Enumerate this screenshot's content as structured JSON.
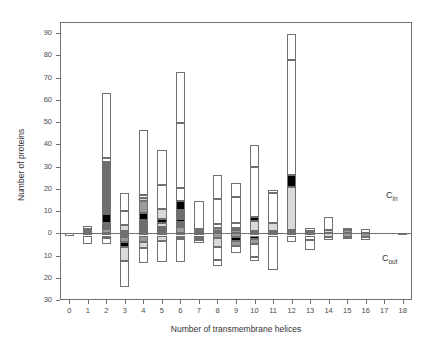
{
  "figure": {
    "title_fragment": "",
    "annotations": [
      {
        "name": "c-in-label",
        "base": "C",
        "sub": "in",
        "x": 386,
        "y": 190
      },
      {
        "name": "c-out-label",
        "base": "C",
        "sub": "out",
        "x": 382,
        "y": 253
      }
    ]
  },
  "chart_data": {
    "type": "bar",
    "title": "",
    "subtitle": "",
    "xlabel": "Number of transmembrane helices",
    "ylabel": "Number of proteins",
    "orientation": "vertical",
    "stacked": true,
    "diverging": true,
    "grid": false,
    "legend": "none",
    "note": "Diverging stacked bars. Upward stacks = C_in topology, downward stacks = C_out topology. Y tick labels below zero are unsigned magnitudes.",
    "xlim": [
      -0.5,
      18.5
    ],
    "ylim": [
      -30,
      95
    ],
    "xticks": [
      0,
      1,
      2,
      3,
      4,
      5,
      6,
      7,
      8,
      9,
      10,
      11,
      12,
      13,
      14,
      15,
      16,
      17,
      18
    ],
    "xticklabels": [
      "0",
      "1",
      "2",
      "3",
      "4",
      "5",
      "6",
      "7",
      "8",
      "9",
      "10",
      "11",
      "12",
      "13",
      "14",
      "15",
      "16",
      "17",
      "18"
    ],
    "yticks": [
      90,
      80,
      70,
      60,
      50,
      40,
      30,
      20,
      10,
      0,
      -10,
      -20,
      -30
    ],
    "yticklabels": [
      "90",
      "80",
      "70",
      "60",
      "50",
      "40",
      "30",
      "20",
      "10",
      "0",
      "10",
      "20",
      "30"
    ],
    "segment_fills": {
      "white": "#ffffff",
      "light_gray": "#d9d9d9",
      "mid_gray": "#9a9a9a",
      "dark_gray": "#6e6e6e",
      "black": "#000000"
    },
    "categories": [
      0,
      1,
      2,
      3,
      4,
      5,
      6,
      7,
      8,
      9,
      10,
      11,
      12,
      13,
      14,
      15,
      16,
      17,
      18
    ],
    "bars": [
      {
        "x": 0,
        "up": [],
        "down": [
          {
            "v": 1.2,
            "fill": "white"
          }
        ]
      },
      {
        "x": 1,
        "up": [
          {
            "v": 1.0,
            "fill": "mid_gray"
          },
          {
            "v": 0.8,
            "fill": "dark_gray"
          },
          {
            "v": 1.5,
            "fill": "white"
          }
        ],
        "down": [
          {
            "v": 1.0,
            "fill": "mid_gray"
          },
          {
            "v": 4.0,
            "fill": "white"
          }
        ]
      },
      {
        "x": 2,
        "up": [
          {
            "v": 2.0,
            "fill": "mid_gray"
          },
          {
            "v": 2.5,
            "fill": "dark_gray"
          },
          {
            "v": 4.0,
            "fill": "black"
          },
          {
            "v": 23.5,
            "fill": "dark_gray"
          },
          {
            "v": 2.0,
            "fill": "white"
          },
          {
            "v": 29.0,
            "fill": "white"
          }
        ],
        "down": [
          {
            "v": 1.0,
            "fill": "mid_gray"
          },
          {
            "v": 1.2,
            "fill": "dark_gray"
          },
          {
            "v": 2.8,
            "fill": "white"
          }
        ]
      },
      {
        "x": 3,
        "up": [
          {
            "v": 1.0,
            "fill": "mid_gray"
          },
          {
            "v": 2.5,
            "fill": "light_gray"
          },
          {
            "v": 6.5,
            "fill": "white"
          },
          {
            "v": 8.0,
            "fill": "white"
          }
        ],
        "down": [
          {
            "v": 1.5,
            "fill": "dark_gray"
          },
          {
            "v": 2.5,
            "fill": "mid_gray"
          },
          {
            "v": 2.0,
            "fill": "black"
          },
          {
            "v": 6.5,
            "fill": "light_gray"
          },
          {
            "v": 11.5,
            "fill": "white"
          }
        ]
      },
      {
        "x": 4,
        "up": [
          {
            "v": 1.0,
            "fill": "mid_gray"
          },
          {
            "v": 5.0,
            "fill": "dark_gray"
          },
          {
            "v": 3.0,
            "fill": "black"
          },
          {
            "v": 5.5,
            "fill": "mid_gray"
          },
          {
            "v": 1.5,
            "fill": "light_gray"
          },
          {
            "v": 1.0,
            "fill": "white"
          },
          {
            "v": 29.5,
            "fill": "white"
          }
        ],
        "down": [
          {
            "v": 1.0,
            "fill": "mid_gray"
          },
          {
            "v": 3.0,
            "fill": "mid_gray"
          },
          {
            "v": 2.5,
            "fill": "light_gray"
          },
          {
            "v": 7.0,
            "fill": "white"
          }
        ]
      },
      {
        "x": 5,
        "up": [
          {
            "v": 1.0,
            "fill": "mid_gray"
          },
          {
            "v": 2.0,
            "fill": "dark_gray"
          },
          {
            "v": 1.5,
            "fill": "light_gray"
          },
          {
            "v": 2.0,
            "fill": "black"
          },
          {
            "v": 4.5,
            "fill": "light_gray"
          },
          {
            "v": 10.5,
            "fill": "white"
          },
          {
            "v": 16.0,
            "fill": "white"
          }
        ],
        "down": [
          {
            "v": 1.0,
            "fill": "mid_gray"
          },
          {
            "v": 2.5,
            "fill": "light_gray"
          },
          {
            "v": 9.5,
            "fill": "white"
          }
        ]
      },
      {
        "x": 6,
        "up": [
          {
            "v": 3.0,
            "fill": "mid_gray"
          },
          {
            "v": 2.0,
            "fill": "dark_gray"
          },
          {
            "v": 1.5,
            "fill": "black"
          },
          {
            "v": 4.0,
            "fill": "dark_gray"
          },
          {
            "v": 4.0,
            "fill": "black"
          },
          {
            "v": 6.0,
            "fill": "white"
          },
          {
            "v": 29.0,
            "fill": "white"
          },
          {
            "v": 23.0,
            "fill": "white"
          }
        ],
        "down": [
          {
            "v": 1.0,
            "fill": "mid_gray"
          },
          {
            "v": 1.5,
            "fill": "dark_gray"
          },
          {
            "v": 10.5,
            "fill": "white"
          }
        ]
      },
      {
        "x": 7,
        "up": [
          {
            "v": 1.0,
            "fill": "mid_gray"
          },
          {
            "v": 1.0,
            "fill": "dark_gray"
          },
          {
            "v": 12.5,
            "fill": "white"
          }
        ],
        "down": [
          {
            "v": 1.0,
            "fill": "mid_gray"
          },
          {
            "v": 2.0,
            "fill": "dark_gray"
          },
          {
            "v": 1.5,
            "fill": "white"
          }
        ]
      },
      {
        "x": 8,
        "up": [
          {
            "v": 1.0,
            "fill": "mid_gray"
          },
          {
            "v": 1.5,
            "fill": "mid_gray"
          },
          {
            "v": 1.5,
            "fill": "white"
          },
          {
            "v": 11.5,
            "fill": "white"
          },
          {
            "v": 10.5,
            "fill": "white"
          }
        ],
        "down": [
          {
            "v": 2.0,
            "fill": "mid_gray"
          },
          {
            "v": 4.0,
            "fill": "light_gray"
          },
          {
            "v": 6.0,
            "fill": "white"
          },
          {
            "v": 2.5,
            "fill": "white"
          }
        ]
      },
      {
        "x": 9,
        "up": [
          {
            "v": 1.5,
            "fill": "mid_gray"
          },
          {
            "v": 1.0,
            "fill": "black"
          },
          {
            "v": 2.0,
            "fill": "white"
          },
          {
            "v": 12.0,
            "fill": "white"
          },
          {
            "v": 6.0,
            "fill": "white"
          }
        ],
        "down": [
          {
            "v": 1.5,
            "fill": "mid_gray"
          },
          {
            "v": 2.0,
            "fill": "black"
          },
          {
            "v": 2.0,
            "fill": "mid_gray"
          },
          {
            "v": 3.5,
            "fill": "white"
          }
        ]
      },
      {
        "x": 10,
        "up": [
          {
            "v": 1.0,
            "fill": "mid_gray"
          },
          {
            "v": 4.5,
            "fill": "light_gray"
          },
          {
            "v": 2.0,
            "fill": "black"
          },
          {
            "v": 22.5,
            "fill": "white"
          },
          {
            "v": 9.5,
            "fill": "white"
          }
        ],
        "down": [
          {
            "v": 1.0,
            "fill": "mid_gray"
          },
          {
            "v": 1.5,
            "fill": "black"
          },
          {
            "v": 2.5,
            "fill": "mid_gray"
          },
          {
            "v": 5.5,
            "fill": "white"
          },
          {
            "v": 2.0,
            "fill": "white"
          }
        ]
      },
      {
        "x": 11,
        "up": [
          {
            "v": 1.0,
            "fill": "mid_gray"
          },
          {
            "v": 3.5,
            "fill": "light_gray"
          },
          {
            "v": 13.5,
            "fill": "white"
          },
          {
            "v": 1.5,
            "fill": "white"
          }
        ],
        "down": [
          {
            "v": 1.0,
            "fill": "mid_gray"
          },
          {
            "v": 15.5,
            "fill": "white"
          }
        ]
      },
      {
        "x": 12,
        "up": [
          {
            "v": 1.5,
            "fill": "dark_gray"
          },
          {
            "v": 19.5,
            "fill": "light_gray"
          },
          {
            "v": 5.0,
            "fill": "black"
          },
          {
            "v": 52.0,
            "fill": "white"
          },
          {
            "v": 11.5,
            "fill": "white"
          }
        ],
        "down": [
          {
            "v": 1.0,
            "fill": "mid_gray"
          },
          {
            "v": 3.0,
            "fill": "white"
          }
        ]
      },
      {
        "x": 13,
        "up": [
          {
            "v": 1.0,
            "fill": "mid_gray"
          },
          {
            "v": 1.5,
            "fill": "white"
          }
        ],
        "down": [
          {
            "v": 1.0,
            "fill": "mid_gray"
          },
          {
            "v": 2.0,
            "fill": "white"
          },
          {
            "v": 4.5,
            "fill": "white"
          }
        ]
      },
      {
        "x": 14,
        "up": [
          {
            "v": 1.5,
            "fill": "light_gray"
          },
          {
            "v": 6.0,
            "fill": "white"
          }
        ],
        "down": [
          {
            "v": 1.5,
            "fill": "light_gray"
          },
          {
            "v": 1.5,
            "fill": "white"
          }
        ]
      },
      {
        "x": 15,
        "up": [
          {
            "v": 1.5,
            "fill": "mid_gray"
          },
          {
            "v": 1.0,
            "fill": "white"
          }
        ],
        "down": [
          {
            "v": 1.5,
            "fill": "mid_gray"
          },
          {
            "v": 1.0,
            "fill": "white"
          }
        ]
      },
      {
        "x": 16,
        "up": [
          {
            "v": 2.0,
            "fill": "white"
          }
        ],
        "down": [
          {
            "v": 1.5,
            "fill": "mid_gray"
          },
          {
            "v": 1.5,
            "fill": "white"
          }
        ]
      },
      {
        "x": 17,
        "up": [],
        "down": []
      },
      {
        "x": 18,
        "up": [],
        "down": [
          {
            "v": 1.0,
            "fill": "white"
          }
        ]
      }
    ]
  }
}
